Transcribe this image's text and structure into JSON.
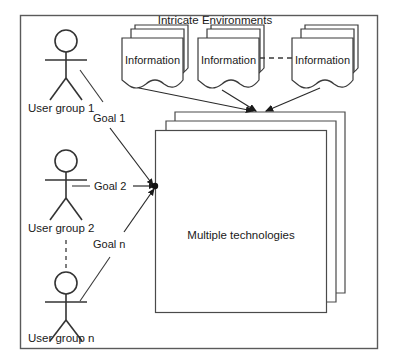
{
  "diagram": {
    "title": "Intricate Environments",
    "center_box_label": "Multiple technologies",
    "documents": [
      {
        "label": "Information"
      },
      {
        "label": "Information"
      },
      {
        "label": "Information"
      }
    ],
    "user_groups": [
      {
        "label": "User group 1"
      },
      {
        "label": "User group 2"
      },
      {
        "label": "User group n"
      }
    ],
    "goals": [
      {
        "label": "Goal 1"
      },
      {
        "label": "Goal 2"
      },
      {
        "label": "Goal n"
      }
    ],
    "colors": {
      "stroke": "#3a3a3a",
      "frame": "#5a5a5a",
      "figure": "#333333",
      "text": "#1a1a1a",
      "background": "#ffffff"
    }
  }
}
